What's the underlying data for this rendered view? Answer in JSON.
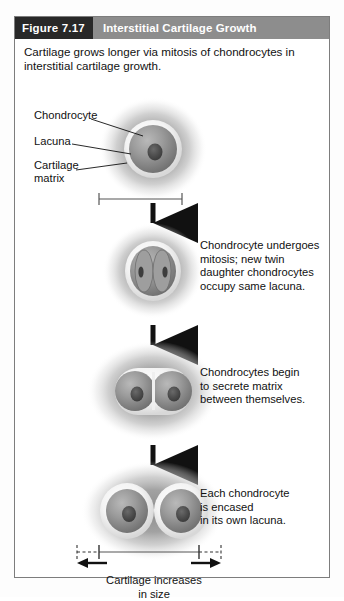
{
  "figure": {
    "number_label": "Figure 7.17",
    "title": "Interstitial Cartilage Growth",
    "intro": "Cartilage grows longer via mitosis of chondrocytes in interstitial cartilage growth.",
    "colors": {
      "number_bar": "#282828",
      "title_bar": "#8d8d8d",
      "frame_border": "#7d7d7d",
      "matrix_gray": "#9a9a9a",
      "lacuna_light": "#f2f2f2",
      "cell_gray": "#8f8f8f",
      "nucleus_dark": "#4a4a4a",
      "arrow_black": "#111111",
      "text": "#111111"
    }
  },
  "callouts": [
    {
      "id": "chondrocyte",
      "label": "Chondrocyte"
    },
    {
      "id": "lacuna",
      "label": "Lacuna"
    },
    {
      "id": "cartilage-matrix",
      "label": "Cartilage\nmatrix"
    }
  ],
  "callout_lines": [
    {
      "id": "chondrocyte",
      "label_line_1": "Chondrocyte"
    },
    {
      "id": "lacuna",
      "label_line_1": "Lacuna"
    },
    {
      "id": "cartilage-matrix",
      "label_line_1": "Cartilage",
      "label_line_2": "matrix"
    }
  ],
  "stages": [
    {
      "id": "stage-1",
      "caption": "",
      "cells": 1,
      "lacunae": 1,
      "has_measure_bar": true
    },
    {
      "id": "stage-2",
      "caption": "Chondrocyte undergoes mitosis; new twin daughter chondrocytes occupy same lacuna.",
      "caption_lines": [
        "Chondrocyte undergoes",
        "mitosis; new twin",
        "daughter chondrocytes",
        "occupy same lacuna."
      ],
      "cells": 2,
      "lacunae": 1,
      "has_measure_bar": false
    },
    {
      "id": "stage-3",
      "caption": "Chondrocytes begin to secrete matrix between themselves.",
      "caption_lines": [
        "Chondrocytes begin",
        "to secrete matrix",
        "between themselves."
      ],
      "cells": 2,
      "lacunae": 2,
      "has_measure_bar": false
    },
    {
      "id": "stage-4",
      "caption": "Each chondrocyte is encased in its own lacuna.",
      "caption_lines": [
        "Each chondrocyte",
        "is encased",
        "in its own lacuna."
      ],
      "cells": 2,
      "lacunae": 2,
      "has_measure_bar": true
    }
  ],
  "growth_label": {
    "line_1": "Cartilage increases",
    "line_2": "in size"
  },
  "arrows": {
    "count": 3,
    "direction": "down",
    "growth_arrow_direction": "outward"
  }
}
